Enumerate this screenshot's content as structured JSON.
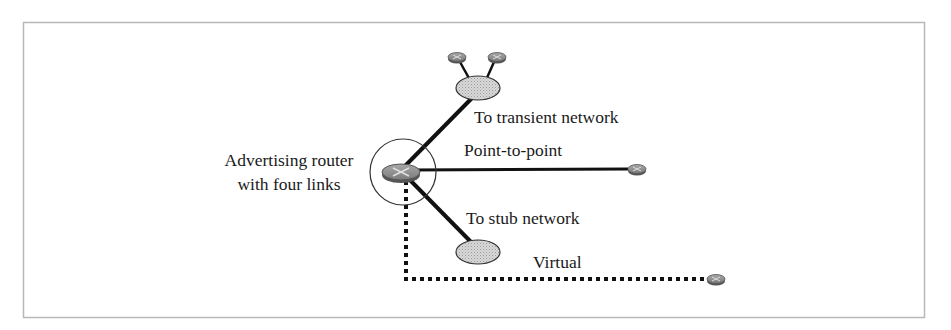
{
  "diagram": {
    "colors": {
      "frame": "#b8b8b8",
      "link": "#111111",
      "router_fill": "#8c8c8c",
      "router_edge": "#555555",
      "network_fill": "#cfcfcf",
      "network_edge": "#333333",
      "circle": "#333333"
    },
    "labels": {
      "router_line1": "Advertising router",
      "router_line2": "with four links",
      "transient": "To transient network",
      "point_to_point": "Point-to-point",
      "stub": "To stub network",
      "virtual": "Virtual"
    },
    "nodes": [
      {
        "id": "advertising-router",
        "type": "router",
        "x": 401,
        "y": 172
      },
      {
        "id": "transient-network",
        "type": "network",
        "x": 478,
        "y": 88
      },
      {
        "id": "transient-router-1",
        "type": "router",
        "x": 457,
        "y": 57
      },
      {
        "id": "transient-router-2",
        "type": "router",
        "x": 497,
        "y": 57
      },
      {
        "id": "p2p-router",
        "type": "router",
        "x": 637,
        "y": 169
      },
      {
        "id": "stub-network",
        "type": "network",
        "x": 478,
        "y": 252
      },
      {
        "id": "virtual-router",
        "type": "router",
        "x": 716,
        "y": 279
      }
    ],
    "links": [
      {
        "from": "advertising-router",
        "to": "transient-network",
        "style": "solid",
        "label": "To transient network"
      },
      {
        "from": "advertising-router",
        "to": "p2p-router",
        "style": "solid",
        "label": "Point-to-point"
      },
      {
        "from": "advertising-router",
        "to": "stub-network",
        "style": "solid",
        "label": "To stub network"
      },
      {
        "from": "advertising-router",
        "to": "virtual-router",
        "style": "dotted",
        "label": "Virtual"
      }
    ]
  }
}
